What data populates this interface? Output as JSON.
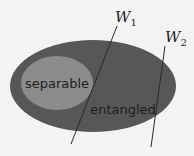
{
  "diagram": {
    "regions": {
      "outer": {
        "label": "entangled",
        "color": "#575757"
      },
      "inner": {
        "label": "separable",
        "color": "#8c8c8c"
      }
    },
    "witnesses": [
      {
        "name": "W",
        "subscript": "1"
      },
      {
        "name": "W",
        "subscript": "2"
      }
    ],
    "line_color": "#2a2a2a",
    "text_color": "#1e1e1e",
    "background": "#f3f3f3"
  }
}
